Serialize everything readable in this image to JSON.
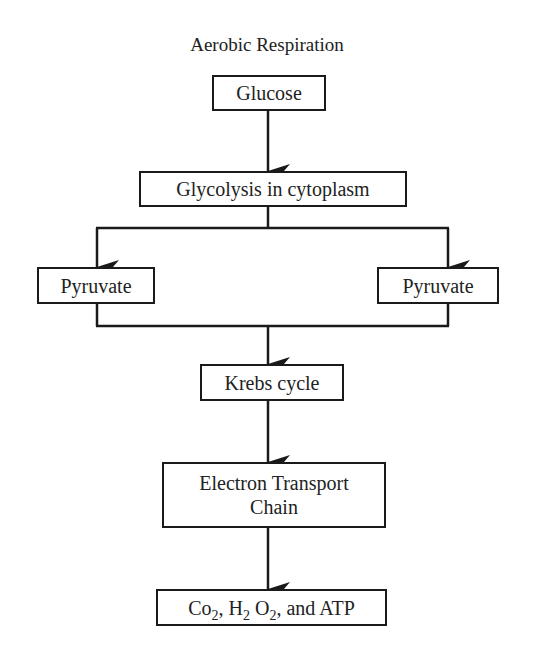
{
  "diagram": {
    "title": "Aerobic Respiration",
    "nodes": {
      "glucose": "Glucose",
      "glycolysis": "Glycolysis in cytoplasm",
      "pyruvate_left": "Pyruvate",
      "pyruvate_right": "Pyruvate",
      "krebs": "Krebs cycle",
      "etc_line1": "Electron Transport",
      "etc_line2": "Chain",
      "products": {
        "co": "Co",
        "sub1": "2",
        "h": ", H",
        "sub2": "2",
        "o": " O",
        "sub3": "2",
        "rest": ", and ATP"
      }
    },
    "edges": [
      {
        "from": "Glucose",
        "to": "Glycolysis in cytoplasm"
      },
      {
        "from": "Glycolysis in cytoplasm",
        "to": "Pyruvate (left)"
      },
      {
        "from": "Glycolysis in cytoplasm",
        "to": "Pyruvate (right)"
      },
      {
        "from": "Pyruvate (left)",
        "to": "Krebs cycle"
      },
      {
        "from": "Pyruvate (right)",
        "to": "Krebs cycle"
      },
      {
        "from": "Krebs cycle",
        "to": "Electron Transport Chain"
      },
      {
        "from": "Electron Transport Chain",
        "to": "Co2, H2 O2, and ATP"
      }
    ],
    "colors": {
      "line": "#1a1a1a",
      "text": "#222222",
      "background": "#ffffff"
    }
  }
}
